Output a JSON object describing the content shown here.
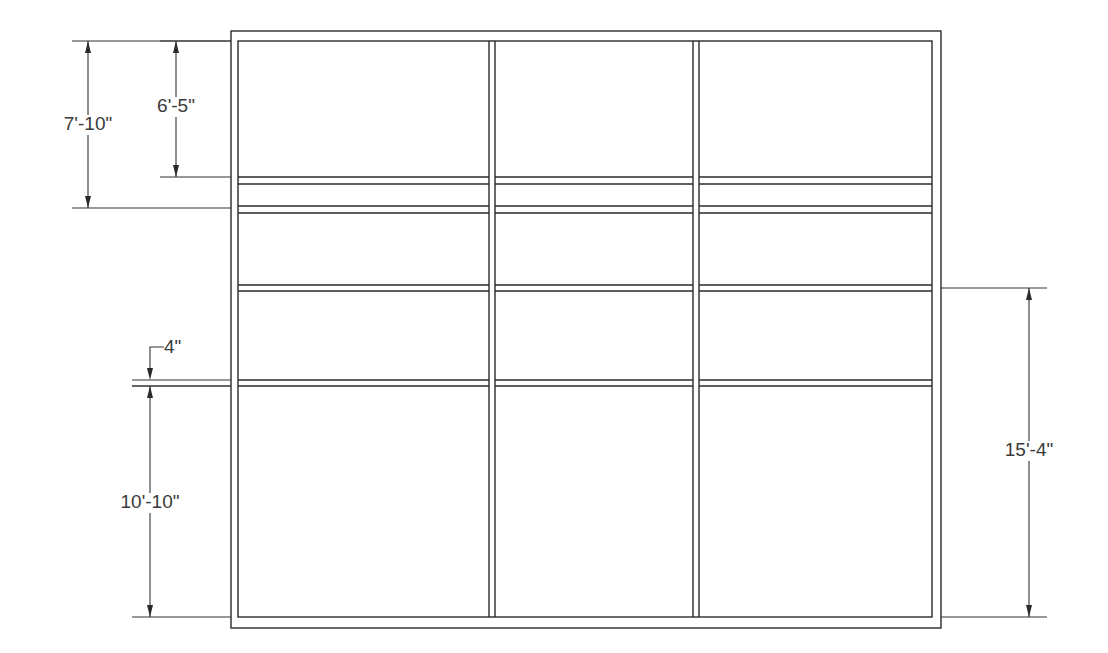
{
  "drawing": {
    "type": "elevation",
    "line_color": "#2a2a2a",
    "background": "#ffffff",
    "frame": {
      "outer": {
        "x1": 231,
        "y1": 31,
        "x2": 941,
        "y2": 628
      },
      "inner": {
        "x1": 238,
        "y1": 41,
        "x2": 932,
        "y2": 617
      }
    },
    "posts_x": [
      [
        489,
        495
      ],
      [
        693,
        699
      ]
    ],
    "rails_y": [
      [
        177,
        184
      ],
      [
        206,
        213
      ],
      [
        285,
        291
      ],
      [
        380,
        386
      ]
    ],
    "dimensions": [
      {
        "id": "dim-7-10",
        "label": "7'-10\"",
        "side": "left",
        "x": 88,
        "y1": 41,
        "y2": 208,
        "ext_from": 72,
        "label_x": 88,
        "label_y": 130
      },
      {
        "id": "dim-6-5",
        "label": "6'-5\"",
        "side": "left",
        "x": 176,
        "y1": 41,
        "y2": 177,
        "ext_from": 160,
        "label_x": 176,
        "label_y": 112
      },
      {
        "id": "dim-4",
        "label": "4\"",
        "side": "left",
        "x": 150,
        "y1": 380,
        "y2": 386,
        "ext_from": 132,
        "label_x": 175,
        "label_y": 352
      },
      {
        "id": "dim-10-10",
        "label": "10'-10\"",
        "side": "left",
        "x": 150,
        "y1": 386,
        "y2": 617,
        "ext_from": 132,
        "label_x": 150,
        "label_y": 508
      },
      {
        "id": "dim-15-4",
        "label": "15'-4\"",
        "side": "right",
        "x": 1029,
        "y1": 288,
        "y2": 617,
        "ext_to": 1047,
        "label_x": 1029,
        "label_y": 456
      }
    ]
  }
}
